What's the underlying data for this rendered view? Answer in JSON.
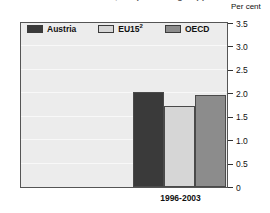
{
  "title_remnant": "Industrial tariff rates, simple average applied MFN",
  "unit_label": "Per cent",
  "chart_data": {
    "type": "bar",
    "title": "Per cent",
    "xlabel": "",
    "ylabel": "Per cent",
    "categories": [
      "1996-2003"
    ],
    "series": [
      {
        "name": "Austria",
        "values": [
          2.03
        ],
        "color": "#3a3a3a"
      },
      {
        "name": "EU15",
        "name_superscript": "2",
        "values": [
          1.72
        ],
        "color": "#d6d6d6"
      },
      {
        "name": "OECD",
        "values": [
          1.97
        ],
        "color": "#8c8c8c"
      }
    ],
    "ylim": [
      0,
      3.5
    ],
    "yticks": [
      "0",
      "0.5",
      "1.0",
      "1.5",
      "2.0",
      "2.5",
      "3.0",
      "3.5"
    ],
    "ytick_values": [
      0,
      0.5,
      1.0,
      1.5,
      2.0,
      2.5,
      3.0,
      3.5
    ],
    "grid": true,
    "legend_position": "top-inside"
  },
  "legend": {
    "items": [
      {
        "label": "Austria",
        "sup": "",
        "color": "#3a3a3a"
      },
      {
        "label": "EU15",
        "sup": "2",
        "color": "#d6d6d6"
      },
      {
        "label": "OECD",
        "sup": "",
        "color": "#8c8c8c"
      }
    ]
  },
  "colors": {
    "plot_background": "#ececec",
    "frame": "#555555",
    "gridline": "#f8f8f8",
    "text": "#111111"
  }
}
